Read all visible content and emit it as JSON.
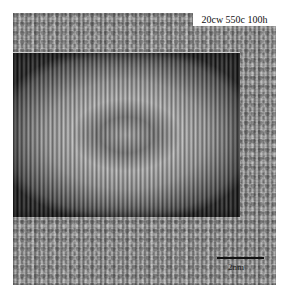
{
  "figure": {
    "type": "HRTEM micrograph with filtered inset",
    "sample_label": "20cw 550c 100h",
    "scale_bar": {
      "label": "2nm"
    },
    "colors": {
      "background": "#ffffff",
      "label_box": "#ffffff",
      "text": "#111111"
    }
  }
}
